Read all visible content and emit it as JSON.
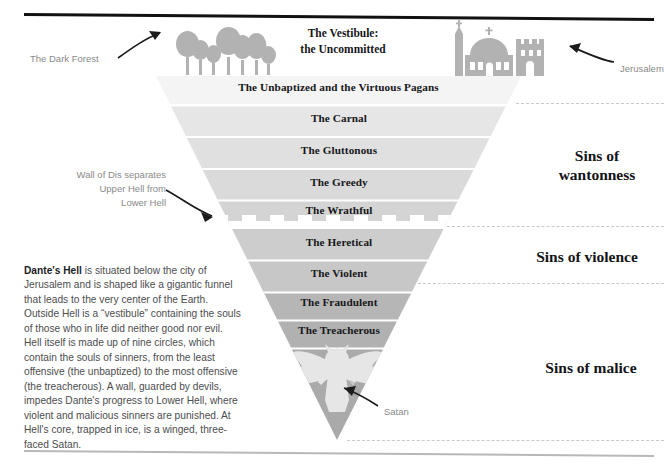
{
  "diagram": {
    "title_heading": "The Vestibule:\nthe Uncommitted",
    "vestibule_line1": "The Vestibule:",
    "vestibule_line2": "the Uncommitted",
    "icons": {
      "forest": "forest-trees-icon",
      "city": "jerusalem-skyline-icon",
      "satan": "winged-satan-icon",
      "arrow_forest": "curved-arrow-icon",
      "arrow_city": "curved-arrow-icon",
      "arrow_wall": "curved-arrow-icon",
      "arrow_satan": "curved-arrow-icon"
    },
    "annotations": [
      {
        "name": "dark-forest",
        "text": "The Dark Forest"
      },
      {
        "name": "jerusalem",
        "text": "Jerusalem"
      },
      {
        "name": "wall-of-dis",
        "text": "Wall of Dis separates\nUpper Hell from\nLower Hell"
      },
      {
        "name": "satan",
        "text": "Satan"
      }
    ],
    "circles": [
      {
        "label": "The Unbaptized and the Virtuous Pagans",
        "color": "#f4f4f4"
      },
      {
        "label": "The Carnal",
        "color": "#e4e4e4"
      },
      {
        "label": "The Gluttonous",
        "color": "#dedede"
      },
      {
        "label": "The Greedy",
        "color": "#d8d8d8"
      },
      {
        "label": "The Wrathful",
        "color": "#d2d2d2"
      },
      {
        "label": "The Heretical",
        "color": "#cccccc"
      },
      {
        "label": "The Violent",
        "color": "#c6c6c6"
      },
      {
        "label": "The Fraudulent",
        "color": "#b4b4b4"
      },
      {
        "label": "The Treacherous",
        "color": "#b0b0b0"
      },
      {
        "label": "",
        "color": "#a9a9a9"
      }
    ],
    "groups": [
      {
        "label": "Sins of\nwantonness",
        "line1": "Sins of",
        "line2": "wantonness"
      },
      {
        "label": "Sins of violence",
        "line1": "Sins of violence",
        "line2": ""
      },
      {
        "label": "Sins of malice",
        "line1": "Sins of malice",
        "line2": ""
      }
    ],
    "body_text_intro": "Dante's Hell",
    "body_text": " is situated below the city of Jerusalem and is shaped like a gigantic funnel that leads to the very center of the Earth. Outside Hell is a “vestibule” containing the souls of those who in life did neither good nor evil. Hell itself is made up of nine circles, which contain the souls of sinners, from the least offensive (the unbaptized) to the most offensive (the treacherous). A wall, guarded by devils, impedes Dante's progress to Lower Hell, where violent and malicious sinners are punished. At Hell's core, trapped in ice, is a winged, three-faced Satan.",
    "colors": {
      "rule_top": "#111111",
      "rule_bottom": "#b8b8b8",
      "annotation_text": "#8a8a8a",
      "body_text": "#4d4d4f",
      "icon_gray": "#b2b2b2",
      "satan_fill": "#e4e4e4",
      "dashed": "#c9c9c9"
    }
  }
}
